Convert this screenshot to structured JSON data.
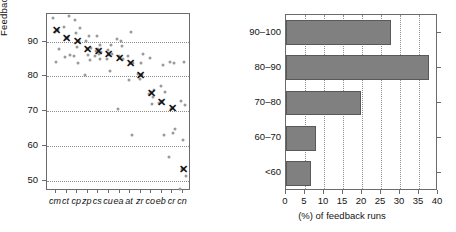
{
  "chart_data": [
    {
      "type": "scatter",
      "panel": "left",
      "title": "",
      "xlabel": "",
      "ylabel": "Feedback accuracy (%)",
      "ylim": [
        47,
        98
      ],
      "yticks": [
        50,
        60,
        70,
        80,
        90
      ],
      "grid": true,
      "categories": [
        "cm",
        "ct",
        "cp",
        "zp",
        "cs",
        "cu",
        "ea",
        "at",
        "zr",
        "co",
        "eb",
        "cr",
        "cn"
      ],
      "mean_marker": "x",
      "series": [
        {
          "name": "per-run feedback accuracy",
          "points": [
            {
              "category": "cm",
              "values": [
                96.8,
                93.4,
                92.9,
                87.9,
                84.2
              ]
            },
            {
              "category": "ct",
              "values": [
                97.4,
                94.3,
                91.3,
                91.0,
                86.2,
                85.5
              ]
            },
            {
              "category": "cp",
              "values": [
                96.4,
                93.9,
                92.4,
                90.3,
                88.6,
                86.0,
                84.0
              ]
            },
            {
              "category": "zp",
              "values": [
                91.8,
                90.2,
                88.3,
                87.9,
                86.1,
                84.8,
                80.3
              ]
            },
            {
              "category": "cs",
              "values": [
                91.6,
                89.2,
                88.0,
                87.3,
                87.1,
                86.5,
                85.9,
                85.1
              ]
            },
            {
              "category": "cu",
              "values": [
                89.1,
                87.6,
                86.6,
                86.3,
                85.0,
                81.5
              ]
            },
            {
              "category": "ea",
              "values": [
                90.8,
                90.2,
                88.8,
                86.0,
                85.4,
                84.9,
                70.7
              ]
            },
            {
              "category": "at",
              "values": [
                92.9,
                86.0,
                84.0,
                83.9,
                78.9,
                63.0
              ]
            },
            {
              "category": "zr",
              "values": [
                86.6,
                83.9,
                80.8,
                80.3,
                79.4
              ]
            },
            {
              "category": "co",
              "values": [
                85.4,
                76.2,
                75.4,
                75.0,
                74.0,
                72.2
              ]
            },
            {
              "category": "eb",
              "values": [
                83.2,
                77.2,
                75.6,
                72.8,
                72.4,
                63.0
              ]
            },
            {
              "category": "cr",
              "values": [
                84.2,
                84.0,
                71.0,
                70.5,
                64.9,
                63.8,
                56.8
              ]
            },
            {
              "category": "cn",
              "values": [
                84.1,
                73.0,
                71.8,
                61.6,
                53.2,
                51.3,
                47.6
              ]
            }
          ]
        }
      ],
      "means": [
        93.4,
        91.2,
        90.3,
        87.9,
        87.2,
        86.4,
        85.4,
        84.0,
        80.3,
        75.1,
        72.7,
        71.0,
        53.2
      ]
    },
    {
      "type": "bar",
      "orientation": "horizontal",
      "panel": "right",
      "title": "",
      "xlabel": "(%) of feedback runs",
      "ylabel": "",
      "categories": [
        "<60",
        "60–70",
        "70–80",
        "80–90",
        "90–100"
      ],
      "values": [
        6.5,
        8.0,
        19.8,
        37.6,
        27.6
      ],
      "xlim": [
        0,
        40
      ],
      "xticks": [
        0,
        5,
        10,
        15,
        20,
        25,
        30,
        35,
        40
      ],
      "grid": true,
      "bar_color": "#808080",
      "bar_edge_color": "#595959"
    }
  ],
  "left": {
    "ylabel": "Feedback accuracy (%)",
    "yticks": [
      "90",
      "80",
      "70",
      "60",
      "50"
    ],
    "categories": [
      "cm",
      "ct",
      "cp",
      "zp",
      "cs",
      "cu",
      "ea",
      "at",
      "zr",
      "co",
      "eb",
      "cr",
      "cn"
    ],
    "mean_glyph": "✕"
  },
  "right": {
    "categories": [
      "90–100",
      "80–90",
      "70–80",
      "60–70",
      "<60"
    ],
    "xticks": [
      "0",
      "5",
      "10",
      "15",
      "20",
      "25",
      "30",
      "35",
      "40"
    ],
    "xlabel": "(%) of feedback runs"
  }
}
